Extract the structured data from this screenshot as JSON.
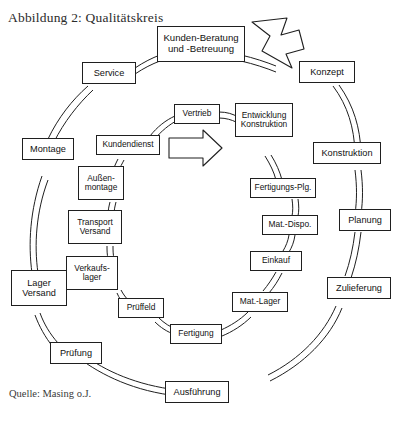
{
  "figure": {
    "title": "Abbildung 2: Qualitätskreis",
    "source": "Quelle: Masing o.J.",
    "diagram_type": "quality-loop-cycle",
    "stroke_color": "#1f1f1f",
    "fill_color": "#ffffff",
    "background": "#ffffff"
  },
  "hub": {
    "label": "Kunden-Beratung\nund -Betreuung"
  },
  "outer_ring": {
    "name": "Qualitätskreis (äußerer Kreis)",
    "direction": "clockwise",
    "nodes": [
      {
        "label": "Konzept"
      },
      {
        "label": "Konstruktion"
      },
      {
        "label": "Planung"
      },
      {
        "label": "Zulieferung"
      },
      {
        "label": "Ausführung"
      },
      {
        "label": "Prüfung"
      },
      {
        "label": "Lager\nVersand"
      },
      {
        "label": "Montage"
      },
      {
        "label": "Service"
      }
    ]
  },
  "inner_ring": {
    "name": "Innerer Kreis (Unternehmensfunktionen)",
    "direction": "clockwise",
    "nodes": [
      {
        "label": "Vertrieb"
      },
      {
        "label": "Entwicklung\nKonstruktion"
      },
      {
        "label": "Fertigungs-Plg."
      },
      {
        "label": "Mat.-Dispo."
      },
      {
        "label": "Einkauf"
      },
      {
        "label": "Mat.-Lager"
      },
      {
        "label": "Fertigung"
      },
      {
        "label": "Prüffeld"
      },
      {
        "label": "Verkaufs-\nlager"
      },
      {
        "label": "Transport\nVersand"
      },
      {
        "label": "Außen-\nmontage"
      },
      {
        "label": "Kundendienst"
      }
    ]
  },
  "arrows": [
    {
      "name": "outer-flow-arrow",
      "shape": "hollow-block-arrow",
      "direction": "clockwise-down-right"
    },
    {
      "name": "inner-flow-arrow",
      "shape": "hollow-block-arrow",
      "direction": "right"
    }
  ]
}
